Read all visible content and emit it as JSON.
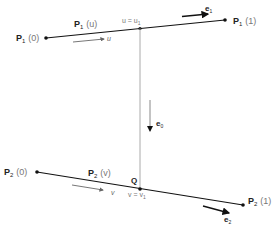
{
  "diagram": {
    "line1": {
      "start_label": "P",
      "start_sub": "1",
      "start_param": "(0)",
      "end_label": "P",
      "end_sub": "1",
      "end_param": "(1)",
      "mid_label": "P",
      "mid_sub": "1",
      "mid_param": "(u)",
      "direction_var": "u",
      "point_label": "u = u",
      "point_sub": "1",
      "vector_label": "e",
      "vector_sub": "1"
    },
    "line2": {
      "start_label": "P",
      "start_sub": "2",
      "start_param": "(0)",
      "end_label": "P",
      "end_sub": "2",
      "end_param": "(1)",
      "mid_label": "P",
      "mid_sub": "2",
      "mid_param": "(v)",
      "direction_var": "v",
      "point_label": "v = v",
      "point_sub": "1",
      "vector_label": "e",
      "vector_sub": "2",
      "q_label": "Q"
    },
    "connector": {
      "vector_label": "e",
      "vector_sub": "0"
    }
  }
}
